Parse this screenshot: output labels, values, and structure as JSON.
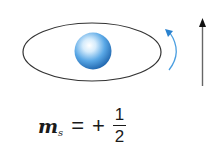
{
  "diagram": {
    "colors": {
      "orbit_stroke": "#333333",
      "sphere_light": "#e8f4ff",
      "sphere_mid": "#5aa8e6",
      "sphere_dark": "#1a5fa8",
      "rotation_arrow": "#4a9ee0",
      "spin_arrow": "#555555"
    },
    "spin_direction": "up"
  },
  "formula": {
    "variable": "m",
    "subscript": "s",
    "equals": "=",
    "sign": "+",
    "numerator": "1",
    "denominator": "2"
  }
}
